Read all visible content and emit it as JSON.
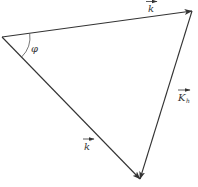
{
  "diagram": {
    "type": "vector-triangle",
    "colors": {
      "line": "#333333",
      "background": "#ffffff"
    },
    "vertices": {
      "left": [
        2,
        37
      ],
      "top_right": [
        192,
        11
      ],
      "bottom": [
        140,
        179
      ]
    },
    "vectors": [
      {
        "id": "k",
        "label": "k",
        "subscript": "",
        "superscript": "",
        "from": "left",
        "to": "top_right"
      },
      {
        "id": "k_prime",
        "label": "k",
        "subscript": "",
        "superscript": "′",
        "from": "left",
        "to": "bottom"
      },
      {
        "id": "K_h",
        "label": "K",
        "subscript": "h",
        "superscript": "",
        "from": "top_right",
        "to": "bottom"
      }
    ],
    "angle": {
      "label": "φ",
      "at": "left",
      "between": [
        "k",
        "k_prime"
      ]
    }
  }
}
